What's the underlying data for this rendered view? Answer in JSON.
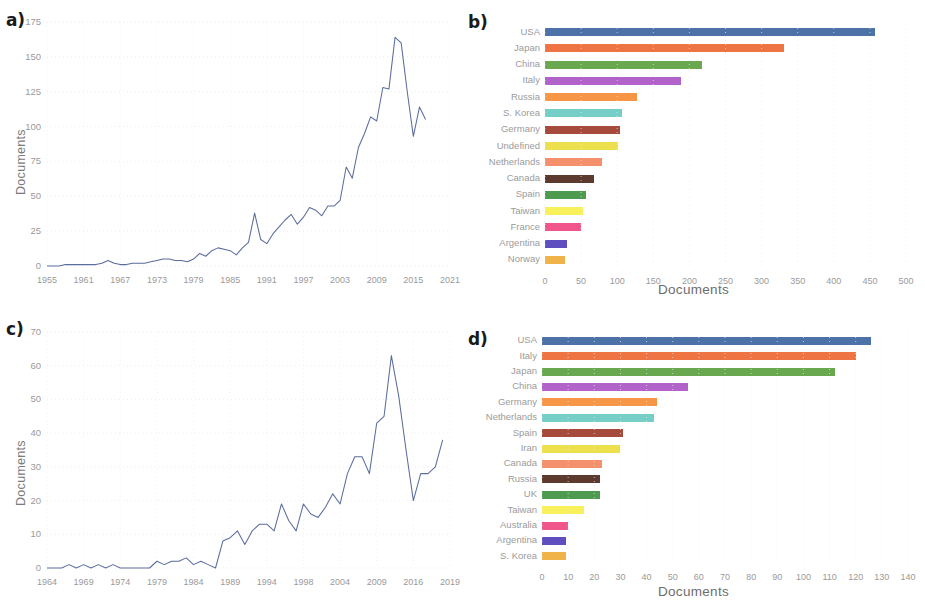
{
  "figure": {
    "panels": [
      {
        "tag": "a)"
      },
      {
        "tag": "b)"
      },
      {
        "tag": "c)"
      },
      {
        "tag": "d)"
      }
    ]
  },
  "panel_a": {
    "tag": "a)",
    "ylabel": "Documents",
    "xlabel": "",
    "yticks": [
      "0",
      "25",
      "50",
      "75",
      "100",
      "125",
      "150",
      "175"
    ],
    "xticks": [
      "1955",
      "1961",
      "1967",
      "1973",
      "1979",
      "1985",
      "1991",
      "1997",
      "2003",
      "2009",
      "2015",
      "2021"
    ],
    "line_color": "#5b6c9e"
  },
  "panel_b": {
    "tag": "b)",
    "xlabel": "Documents",
    "xticks": [
      "0",
      "50",
      "100",
      "150",
      "200",
      "250",
      "300",
      "350",
      "400",
      "450",
      "500"
    ]
  },
  "panel_c": {
    "tag": "c)",
    "ylabel": "Documents",
    "xlabel": "",
    "yticks": [
      "0",
      "10",
      "20",
      "30",
      "40",
      "50",
      "60",
      "70"
    ],
    "xticks": [
      "1964",
      "1969",
      "1974",
      "1979",
      "1984",
      "1989",
      "1994",
      "1998",
      "2004",
      "2009",
      "2016",
      "2019"
    ],
    "line_color": "#5b6c9e"
  },
  "panel_d": {
    "tag": "d)",
    "xlabel": "Documents",
    "xticks": [
      "0",
      "10",
      "20",
      "30",
      "40",
      "50",
      "60",
      "70",
      "80",
      "90",
      "100",
      "110",
      "120",
      "130",
      "140"
    ]
  },
  "chart_data": [
    {
      "id": "panel-a",
      "type": "line",
      "title": "",
      "xlabel": "",
      "ylabel": "Documents",
      "xlim": [
        1955,
        2021
      ],
      "ylim": [
        0,
        175
      ],
      "grid": true,
      "legend": "none",
      "color": "#5b6c9e",
      "x": [
        1955,
        1956,
        1957,
        1958,
        1959,
        1960,
        1961,
        1962,
        1963,
        1964,
        1965,
        1966,
        1967,
        1968,
        1969,
        1970,
        1971,
        1972,
        1973,
        1974,
        1975,
        1976,
        1977,
        1978,
        1979,
        1980,
        1981,
        1982,
        1983,
        1984,
        1985,
        1986,
        1987,
        1988,
        1989,
        1990,
        1991,
        1992,
        1993,
        1994,
        1995,
        1996,
        1997,
        1998,
        1999,
        2000,
        2001,
        2002,
        2003,
        2004,
        2005,
        2006,
        2007,
        2008,
        2009,
        2010,
        2011,
        2012,
        2013,
        2014,
        2015,
        2016,
        2017
      ],
      "y": [
        0,
        0,
        0,
        1,
        1,
        1,
        1,
        1,
        1,
        2,
        4,
        2,
        1,
        1,
        2,
        2,
        2,
        3,
        4,
        5,
        5,
        4,
        4,
        3,
        5,
        9,
        7,
        11,
        13,
        12,
        11,
        8,
        13,
        17,
        38,
        19,
        16,
        23,
        28,
        33,
        37,
        30,
        35,
        42,
        40,
        36,
        43,
        43,
        47,
        71,
        63,
        85,
        95,
        107,
        104,
        128,
        127,
        164,
        160,
        125,
        93,
        114,
        105
      ],
      "series_note": "Documents per year"
    },
    {
      "id": "panel-b",
      "type": "bar",
      "orientation": "horizontal",
      "title": "",
      "xlabel": "Documents",
      "ylabel": "",
      "xlim": [
        0,
        500
      ],
      "grid": true,
      "legend": "none",
      "categories": [
        "USA",
        "Japan",
        "China",
        "Italy",
        "Russia",
        "S. Korea",
        "Germany",
        "Undefined",
        "Netherlands",
        "Canada",
        "Spain",
        "Taiwan",
        "France",
        "Argentina",
        "Norway"
      ],
      "values": [
        457,
        331,
        217,
        188,
        127,
        106,
        104,
        101,
        79,
        68,
        57,
        53,
        50,
        30,
        28
      ],
      "colors": [
        "#4c72a8",
        "#ef7444",
        "#6aa84f",
        "#b163c9",
        "#f79646",
        "#76cfc6",
        "#a64b3c",
        "#ece14c",
        "#f4906b",
        "#5c3a2e",
        "#4e9a4e",
        "#f8f15c",
        "#f0568c",
        "#5f4ec0",
        "#efb34a"
      ]
    },
    {
      "id": "panel-c",
      "type": "line",
      "title": "",
      "xlabel": "",
      "ylabel": "Documents",
      "xlim": [
        1964,
        2019
      ],
      "ylim": [
        0,
        70
      ],
      "grid": true,
      "legend": "none",
      "color": "#5b6c9e",
      "x": [
        1964,
        1965,
        1966,
        1967,
        1968,
        1969,
        1970,
        1971,
        1972,
        1973,
        1974,
        1975,
        1976,
        1977,
        1978,
        1979,
        1980,
        1981,
        1982,
        1983,
        1984,
        1985,
        1986,
        1987,
        1988,
        1989,
        1990,
        1991,
        1992,
        1993,
        1994,
        1995,
        1996,
        1997,
        1998,
        1999,
        2000,
        2001,
        2002,
        2003,
        2004,
        2005,
        2006,
        2007,
        2008,
        2009,
        2010,
        2011,
        2012,
        2013,
        2014,
        2015,
        2016,
        2017,
        2018
      ],
      "y": [
        0,
        0,
        0,
        1,
        0,
        1,
        0,
        1,
        0,
        1,
        0,
        0,
        0,
        0,
        0,
        2,
        1,
        2,
        2,
        3,
        1,
        2,
        1,
        0,
        8,
        9,
        11,
        7,
        11,
        13,
        13,
        11,
        19,
        14,
        11,
        19,
        16,
        15,
        18,
        22,
        19,
        28,
        33,
        33,
        28,
        43,
        45,
        63,
        51,
        35,
        20,
        28,
        28,
        30,
        38
      ],
      "series_note": "Documents per year"
    },
    {
      "id": "panel-d",
      "type": "bar",
      "orientation": "horizontal",
      "title": "",
      "xlabel": "Documents",
      "ylabel": "",
      "xlim": [
        0,
        140
      ],
      "grid": true,
      "legend": "none",
      "categories": [
        "USA",
        "Italy",
        "Japan",
        "China",
        "Germany",
        "Netherlands",
        "Spain",
        "Iran",
        "Canada",
        "Russia",
        "UK",
        "Taiwan",
        "Australia",
        "Argentina",
        "S. Korea"
      ],
      "values": [
        126,
        120,
        112,
        56,
        44,
        43,
        31,
        30,
        23,
        22,
        22,
        16,
        10,
        9,
        9
      ],
      "colors": [
        "#4c72a8",
        "#ef7444",
        "#6aa84f",
        "#b163c9",
        "#f79646",
        "#76cfc6",
        "#a64b3c",
        "#ece14c",
        "#f4906b",
        "#5c3a2e",
        "#4e9a4e",
        "#f8f15c",
        "#f0568c",
        "#5f4ec0",
        "#efb34a"
      ]
    }
  ]
}
